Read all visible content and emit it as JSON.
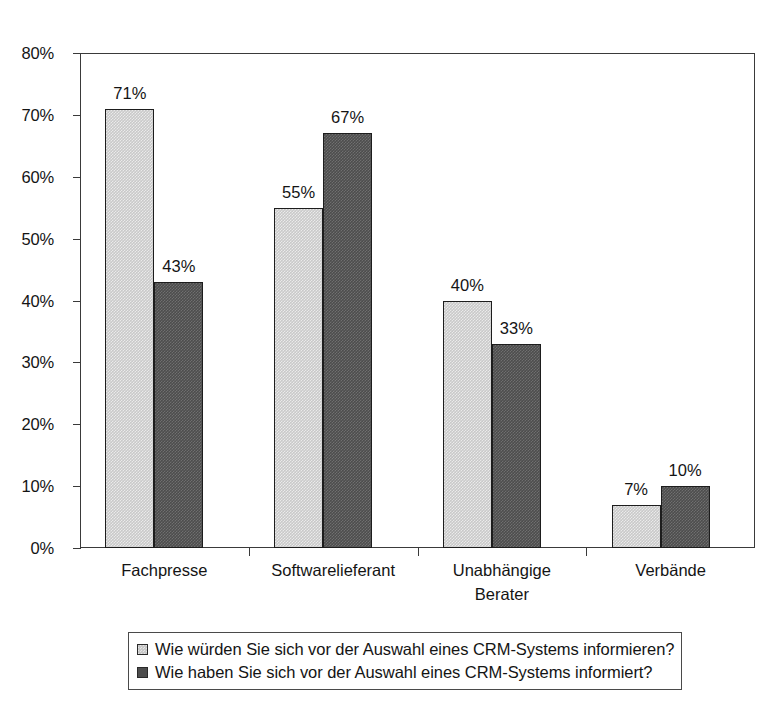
{
  "chart_data": {
    "type": "bar",
    "title": "",
    "xlabel": "",
    "ylabel": "",
    "ylim": [
      0,
      80
    ],
    "y_tick_labels": [
      "0%",
      "10%",
      "20%",
      "30%",
      "40%",
      "50%",
      "60%",
      "70%",
      "80%"
    ],
    "y_tick_values": [
      0,
      10,
      20,
      30,
      40,
      50,
      60,
      70,
      80
    ],
    "grid": false,
    "legend_position": "bottom",
    "categories": [
      "Fachpresse",
      "Softwarelieferant",
      "Unabhängige\nBerater",
      "Verbände"
    ],
    "series": [
      {
        "name": "Wie würden Sie sich vor der Auswahl eines CRM-Systems informieren?",
        "color": "#c9c9c9",
        "values": [
          71,
          55,
          40,
          7
        ],
        "value_labels": [
          "71%",
          "55%",
          "40%",
          "7%"
        ]
      },
      {
        "name": "Wie haben Sie sich vor der Auswahl eines CRM-Systems informiert?",
        "color": "#4d4d4d",
        "values": [
          43,
          67,
          33,
          10
        ],
        "value_labels": [
          "43%",
          "67%",
          "33%",
          "10%"
        ]
      }
    ]
  },
  "legend": {
    "entries": [
      {
        "label": "Wie würden Sie sich vor der Auswahl eines CRM-Systems informieren?"
      },
      {
        "label": "Wie haben Sie sich vor der Auswahl eines CRM-Systems informiert?"
      }
    ]
  },
  "axis": {
    "y_labels": [
      "80%",
      "70%",
      "60%",
      "50%",
      "40%",
      "30%",
      "20%",
      "10%",
      "0%"
    ],
    "x_labels": [
      "Fachpresse",
      "Softwarelieferant",
      "Unabhängige\nBerater",
      "Verbände"
    ]
  }
}
